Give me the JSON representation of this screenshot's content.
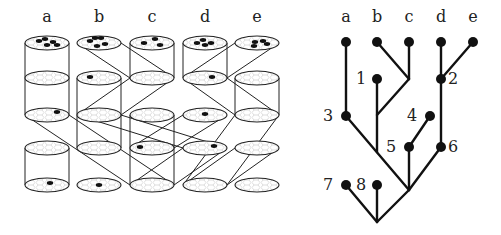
{
  "left_panel": {
    "title": "Cylinder lineage diagram",
    "column_labels": [
      "a",
      "b",
      "c",
      "d",
      "e"
    ],
    "column_x": [
      47,
      99,
      152,
      205,
      257
    ],
    "row_y": [
      43,
      78,
      115,
      148,
      185
    ],
    "ellipse": {
      "rx": 22,
      "ry": 7
    },
    "disks": [
      {
        "col": 0,
        "row": 0,
        "dots": [
          [
            -8,
            -2
          ],
          [
            0,
            2
          ],
          [
            6,
            -1
          ],
          [
            -2,
            -4
          ],
          [
            10,
            2
          ]
        ]
      },
      {
        "col": 1,
        "row": 0,
        "dots": [
          [
            -9,
            -2
          ],
          [
            -4,
            -5
          ],
          [
            2,
            -5
          ],
          [
            6,
            1
          ],
          [
            -2,
            3
          ]
        ]
      },
      {
        "col": 2,
        "row": 0,
        "dots": [
          [
            -8,
            0
          ],
          [
            3,
            -4
          ],
          [
            8,
            2
          ]
        ]
      },
      {
        "col": 3,
        "row": 0,
        "dots": [
          [
            -8,
            0
          ],
          [
            -2,
            -3
          ],
          [
            6,
            0
          ],
          [
            0,
            2
          ]
        ]
      },
      {
        "col": 4,
        "row": 0,
        "dots": [
          [
            -2,
            -1
          ],
          [
            6,
            -2
          ],
          [
            -3,
            3
          ],
          [
            10,
            1
          ]
        ]
      },
      {
        "col": 0,
        "row": 1,
        "dots": []
      },
      {
        "col": 1,
        "row": 1,
        "dots": [
          [
            -9,
            -1
          ]
        ]
      },
      {
        "col": 2,
        "row": 1,
        "dots": []
      },
      {
        "col": 3,
        "row": 1,
        "dots": [
          [
            7,
            -1
          ]
        ]
      },
      {
        "col": 4,
        "row": 1,
        "dots": []
      },
      {
        "col": 0,
        "row": 2,
        "dots": [
          [
            10,
            -3
          ]
        ]
      },
      {
        "col": 1,
        "row": 2,
        "dots": []
      },
      {
        "col": 2,
        "row": 2,
        "dots": []
      },
      {
        "col": 3,
        "row": 2,
        "dots": [
          [
            0,
            -1
          ]
        ]
      },
      {
        "col": 4,
        "row": 2,
        "dots": []
      },
      {
        "col": 0,
        "row": 3,
        "dots": []
      },
      {
        "col": 1,
        "row": 3,
        "dots": []
      },
      {
        "col": 2,
        "row": 3,
        "dots": [
          [
            -12,
            -1
          ]
        ]
      },
      {
        "col": 3,
        "row": 3,
        "dots": [
          [
            9,
            -2
          ]
        ]
      },
      {
        "col": 4,
        "row": 3,
        "dots": []
      },
      {
        "col": 0,
        "row": 4,
        "dots": [
          [
            3,
            -2
          ]
        ]
      },
      {
        "col": 1,
        "row": 4,
        "dots": [
          [
            0,
            0
          ]
        ]
      },
      {
        "col": 2,
        "row": 4,
        "dots": []
      },
      {
        "col": 3,
        "row": 4,
        "dots": []
      },
      {
        "col": 4,
        "row": 4,
        "dots": []
      }
    ],
    "cylinders": [
      {
        "col": 0,
        "from": 0,
        "to": 2
      },
      {
        "col": 0,
        "from": 3,
        "to": 4
      },
      {
        "col": 1,
        "from": 1,
        "to": 3
      },
      {
        "col": 2,
        "from": 0,
        "to": 1
      },
      {
        "col": 2,
        "from": 2,
        "to": 4
      },
      {
        "col": 3,
        "from": 0,
        "to": 1
      },
      {
        "col": 4,
        "from": 1,
        "to": 2
      }
    ],
    "transfers": [
      {
        "from": [
          1,
          0
        ],
        "to": [
          2,
          1
        ]
      },
      {
        "from": [
          2,
          1
        ],
        "to": [
          1,
          2
        ]
      },
      {
        "from": [
          4,
          0
        ],
        "to": [
          3,
          1
        ]
      },
      {
        "from": [
          3,
          1
        ],
        "to": [
          4,
          2
        ]
      },
      {
        "from": [
          0,
          2
        ],
        "to": [
          2,
          4
        ]
      },
      {
        "from": [
          1,
          2
        ],
        "to": [
          3,
          3
        ]
      },
      {
        "from": [
          3,
          2
        ],
        "to": [
          2,
          3
        ]
      },
      {
        "from": [
          4,
          2
        ],
        "to": [
          3,
          4
        ]
      },
      {
        "from": [
          4,
          3
        ],
        "to": [
          3,
          4
        ]
      },
      {
        "from": [
          3,
          3
        ],
        "to": [
          2,
          4
        ]
      }
    ]
  },
  "right_panel": {
    "title": "Genealogical tree",
    "leaf_labels": [
      {
        "text": "a",
        "x": 346,
        "y": 22
      },
      {
        "text": "b",
        "x": 377,
        "y": 22
      },
      {
        "text": "c",
        "x": 409,
        "y": 22
      },
      {
        "text": "d",
        "x": 441,
        "y": 22
      },
      {
        "text": "e",
        "x": 473,
        "y": 22
      }
    ],
    "nodes": [
      {
        "id": "a",
        "x": 346,
        "y": 42
      },
      {
        "id": "b",
        "x": 377,
        "y": 42
      },
      {
        "id": "c",
        "x": 409,
        "y": 42
      },
      {
        "id": "d",
        "x": 441,
        "y": 42
      },
      {
        "id": "e",
        "x": 473,
        "y": 42
      },
      {
        "id": "1",
        "x": 377,
        "y": 79
      },
      {
        "id": "2",
        "x": 441,
        "y": 79
      },
      {
        "id": "3",
        "x": 346,
        "y": 116
      },
      {
        "id": "4",
        "x": 430,
        "y": 116
      },
      {
        "id": "5",
        "x": 409,
        "y": 147
      },
      {
        "id": "6",
        "x": 441,
        "y": 147
      },
      {
        "id": "7",
        "x": 346,
        "y": 185
      },
      {
        "id": "8",
        "x": 377,
        "y": 185
      }
    ],
    "node_labels": [
      {
        "text": "1",
        "x": 361,
        "y": 84
      },
      {
        "text": "2",
        "x": 453,
        "y": 84
      },
      {
        "text": "3",
        "x": 328,
        "y": 121
      },
      {
        "text": "4",
        "x": 412,
        "y": 121
      },
      {
        "text": "5",
        "x": 391,
        "y": 152
      },
      {
        "text": "6",
        "x": 453,
        "y": 152
      },
      {
        "text": "7",
        "x": 328,
        "y": 190
      },
      {
        "text": "8",
        "x": 361,
        "y": 190
      }
    ],
    "edges": [
      [
        346,
        42,
        346,
        116
      ],
      [
        377,
        42,
        409,
        79
      ],
      [
        409,
        42,
        409,
        79
      ],
      [
        409,
        79,
        377,
        115
      ],
      [
        377,
        79,
        377,
        152
      ],
      [
        441,
        42,
        441,
        147
      ],
      [
        473,
        42,
        441,
        79
      ],
      [
        346,
        116,
        409,
        190
      ],
      [
        430,
        116,
        409,
        147
      ],
      [
        409,
        147,
        409,
        190
      ],
      [
        441,
        147,
        409,
        190
      ],
      [
        409,
        190,
        377,
        222
      ],
      [
        346,
        185,
        377,
        222
      ],
      [
        377,
        185,
        377,
        222
      ]
    ]
  }
}
